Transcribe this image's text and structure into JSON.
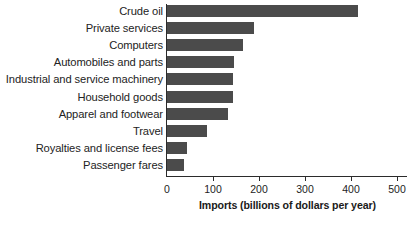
{
  "chart_data": {
    "type": "bar",
    "orientation": "horizontal",
    "title": "",
    "xlabel": "Imports (billions of dollars per year)",
    "ylabel": "",
    "xlim": [
      0,
      520
    ],
    "xticks": [
      0,
      100,
      200,
      300,
      400,
      500
    ],
    "xtick_labels": [
      "0",
      "100",
      "200",
      "300",
      "400",
      "500"
    ],
    "grid": false,
    "legend": null,
    "bar_color": "#4b4b4b",
    "axis_color": "#2b2b2b",
    "background": "#ffffff",
    "categories": [
      "Crude oil",
      "Private services",
      "Computers",
      "Automobiles and parts",
      "Industrial and service machinery",
      "Household goods",
      "Apparel and footwear",
      "Travel",
      "Royalties and license fees",
      "Passenger fares"
    ],
    "values": [
      415,
      190,
      165,
      145,
      143,
      143,
      133,
      87,
      43,
      37
    ]
  },
  "axis": {
    "x_title": "Imports (billions of dollars per year)"
  }
}
